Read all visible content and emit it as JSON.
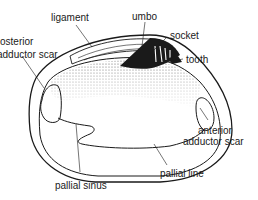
{
  "diagram": {
    "labels": {
      "ligament": "ligament",
      "umbo": "umbo",
      "socket": "socket",
      "tooth": "tooth",
      "posterior_line1": "osterior",
      "posterior_line2": "adductor scar",
      "anterior_line1": "anterior",
      "anterior_line2": "adductor scar",
      "pallial_line": "pallial line",
      "pallial_sinus": "pallial sinus"
    },
    "colors": {
      "ink": "#1a1a1a",
      "background": "#ffffff",
      "stipple": "#333333"
    }
  }
}
